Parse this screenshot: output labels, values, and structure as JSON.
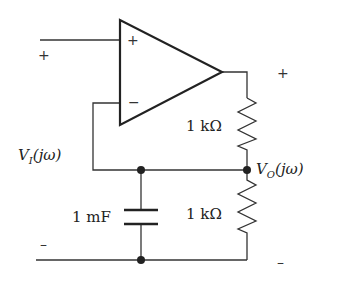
{
  "circuit": {
    "opamp": {
      "noninverting_label": "+",
      "inverting_label": "−"
    },
    "input": {
      "plus_label": "+",
      "minus_label": "–",
      "voltage": {
        "main": "V",
        "sub": "I",
        "arg": "(jω)"
      }
    },
    "output": {
      "plus_label": "+",
      "minus_label": "–",
      "voltage": {
        "main": "V",
        "sub": "O",
        "arg": "(jω)"
      }
    },
    "components": {
      "r_top": "1 kΩ",
      "r_bottom": "1 kΩ",
      "capacitor": "1 mF"
    },
    "colors": {
      "wire": "#333333",
      "label": "#222222",
      "background": "#ffffff"
    }
  }
}
